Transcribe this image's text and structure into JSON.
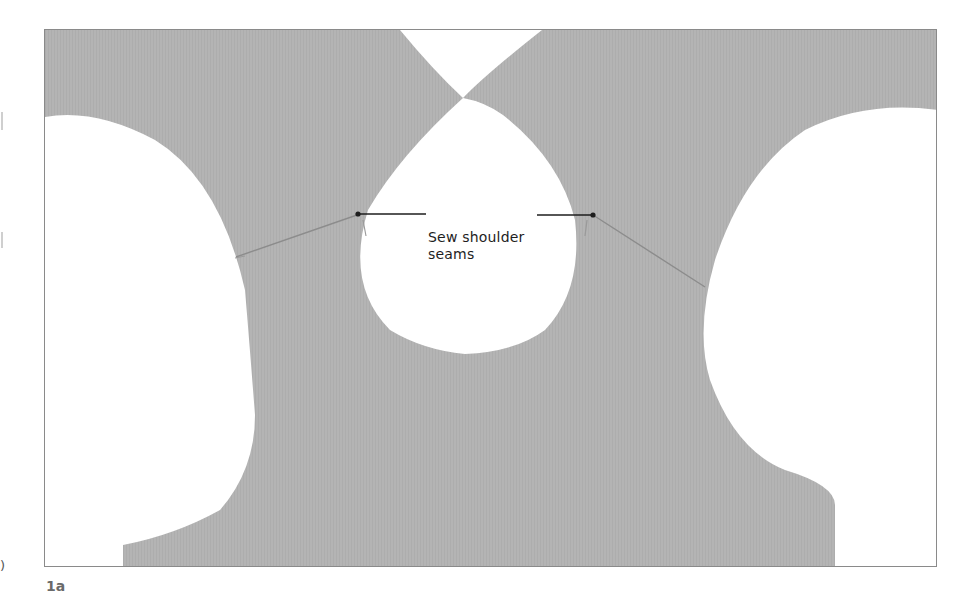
{
  "figure": {
    "label": "1a",
    "annotation": {
      "line1": "Sew shoulder",
      "line2": "seams"
    },
    "colors": {
      "fabric": "#b3b3b3",
      "background": "#ffffff",
      "leader_line": "#1e1e1e",
      "seam_line": "#8c8c8c",
      "frame_border": "#8a8a8a"
    }
  },
  "margin": {
    "bottom_mark": ")"
  }
}
